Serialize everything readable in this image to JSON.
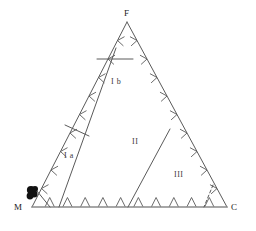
{
  "figure": {
    "type": "ternary-classification-diagram",
    "background_color": "#ffffff",
    "line_color": "#5a5a5a",
    "baseline_color": "#8a8a8a",
    "marker_color": "#111111",
    "text_color": "#1a1a1a"
  },
  "vertices": {
    "top": {
      "label": "F",
      "x": 127,
      "y": 22
    },
    "bottom_left": {
      "label": "M",
      "x": 32,
      "y": 207
    },
    "bottom_right": {
      "label": "C",
      "x": 227,
      "y": 207
    }
  },
  "regions": [
    {
      "id": "Ia",
      "label": "I a",
      "x": 66,
      "y": 156
    },
    {
      "id": "Ib",
      "label": "I b",
      "x": 113,
      "y": 82
    },
    {
      "id": "II",
      "label": "II",
      "x": 135,
      "y": 142
    },
    {
      "id": "III",
      "label": "III",
      "x": 178,
      "y": 175
    }
  ],
  "edges": {
    "left": {
      "from": "M",
      "to": "F",
      "tick_count": 9,
      "tick_style": "inward-chevron"
    },
    "right": {
      "from": "F",
      "to": "C",
      "tick_count": 9,
      "tick_style": "inward-chevron"
    },
    "bottom": {
      "from": "M",
      "to": "C",
      "tick_count": 10,
      "tick_style": "downward-vee"
    }
  },
  "internal_lines": [
    {
      "id": "divider-1",
      "from_x": 116,
      "from_y": 48,
      "to_x": 59,
      "to_y": 207
    },
    {
      "id": "divider-2",
      "from_x": 170,
      "from_y": 129,
      "to_x": 128,
      "to_y": 207
    },
    {
      "id": "cap-line-Ib",
      "from_x": 97,
      "from_y": 59,
      "to_x": 133,
      "to_y": 59
    },
    {
      "id": "cap-line-Ia",
      "from_x": 65,
      "from_y": 125,
      "to_x": 89,
      "to_y": 136
    },
    {
      "id": "corner-notch-left",
      "from_x": 37,
      "from_y": 191,
      "to_x": 50,
      "to_y": 207
    },
    {
      "id": "dashed-right",
      "from_x": 213,
      "from_y": 185,
      "to_x": 204,
      "to_y": 207,
      "dashed": true
    }
  ],
  "data_points": {
    "name": "sample-cluster",
    "count": 4,
    "points": [
      {
        "x": 31,
        "y": 190,
        "r": 4.1
      },
      {
        "x": 34,
        "y": 194,
        "r": 3.6
      },
      {
        "x": 30,
        "y": 196,
        "r": 3.4
      },
      {
        "x": 35,
        "y": 189,
        "r": 3.0
      }
    ]
  }
}
